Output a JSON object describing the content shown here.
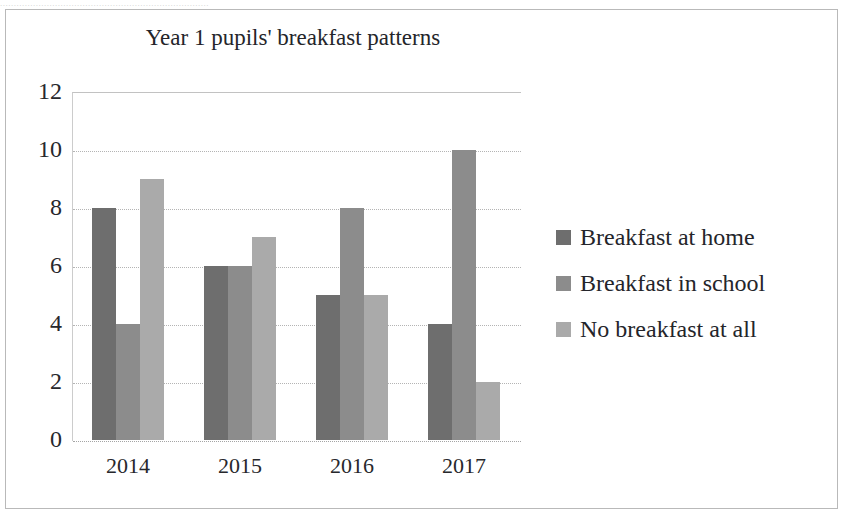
{
  "scan": {
    "top_artifact_text": "............................................................................"
  },
  "chart_data": {
    "type": "bar",
    "title": "Year 1 pupils' breakfast patterns",
    "xlabel": "",
    "ylabel": "",
    "categories": [
      "2014",
      "2015",
      "2016",
      "2017"
    ],
    "series": [
      {
        "name": "Breakfast at home",
        "values": [
          8,
          6,
          5,
          4
        ],
        "color": "#6e6e6e"
      },
      {
        "name": "Breakfast in school",
        "values": [
          4,
          6,
          8,
          10
        ],
        "color": "#8c8c8c"
      },
      {
        "name": "No breakfast at all",
        "values": [
          9,
          7,
          5,
          2
        ],
        "color": "#aaaaaa"
      }
    ],
    "ylim": [
      0,
      12
    ],
    "ytick_step": 2,
    "yticks": [
      "12",
      "10",
      "8",
      "6",
      "4",
      "2",
      "0"
    ],
    "grid": true,
    "legend_position": "right"
  }
}
